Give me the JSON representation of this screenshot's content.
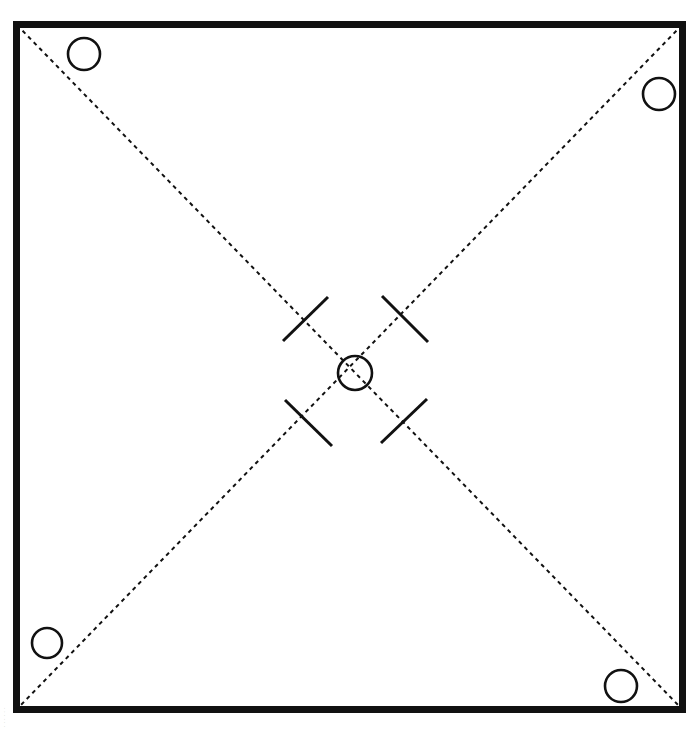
{
  "figure": {
    "canvas": {
      "width": 699,
      "height": 731,
      "background": "#ffffff"
    },
    "colors": {
      "ink": "#111111",
      "paper": "#ffffff",
      "margin_text": "#b9b9b9"
    },
    "frame": {
      "label": "outer plate outline",
      "x": 13,
      "y": 21,
      "width": 673,
      "height": 692,
      "stroke_width": 7,
      "stroke": "#111111",
      "fill": "none"
    },
    "diagonals": [
      {
        "label": "diagonal-centerline-nw-se",
        "x1": 17,
        "y1": 25,
        "x2": 682,
        "y2": 709,
        "dash": "4 4",
        "stroke_width": 2
      },
      {
        "label": "diagonal-centerline-ne-sw",
        "x1": 682,
        "y1": 25,
        "x2": 17,
        "y2": 709,
        "dash": "4 4",
        "stroke_width": 2
      }
    ],
    "circles": [
      {
        "label": "bore-top-left",
        "cx": 84,
        "cy": 54,
        "r": 16,
        "stroke_width": 2.6
      },
      {
        "label": "bore-top-right",
        "cx": 659,
        "cy": 94,
        "r": 16,
        "stroke_width": 2.6
      },
      {
        "label": "bore-bottom-left",
        "cx": 47,
        "cy": 643,
        "r": 15,
        "stroke_width": 2.6
      },
      {
        "label": "bore-bottom-right",
        "cx": 621,
        "cy": 686,
        "r": 16,
        "stroke_width": 2.6
      },
      {
        "label": "bore-center",
        "cx": 355,
        "cy": 373,
        "r": 17,
        "stroke_width": 2.6
      }
    ],
    "tick_marks": [
      {
        "label": "tick-upper-left",
        "x1": 283,
        "y1": 341,
        "x2": 328,
        "y2": 297,
        "stroke_width": 3
      },
      {
        "label": "tick-upper-right",
        "x1": 382,
        "y1": 296,
        "x2": 428,
        "y2": 342,
        "stroke_width": 3
      },
      {
        "label": "tick-lower-left",
        "x1": 285,
        "y1": 400,
        "x2": 332,
        "y2": 446,
        "stroke_width": 3
      },
      {
        "label": "tick-lower-right",
        "x1": 381,
        "y1": 443,
        "x2": 427,
        "y2": 399,
        "stroke_width": 3
      }
    ],
    "margin_note": {
      "label": "scan margin imprint",
      "text": "· · · · · ·"
    }
  },
  "chart_data": {
    "type": "diagram",
    "elements": {
      "frame_rect": {
        "x": 13,
        "y": 21,
        "w": 673,
        "h": 692
      },
      "diagonal_count": 2,
      "circle_count": 5,
      "tick_count": 4
    }
  }
}
